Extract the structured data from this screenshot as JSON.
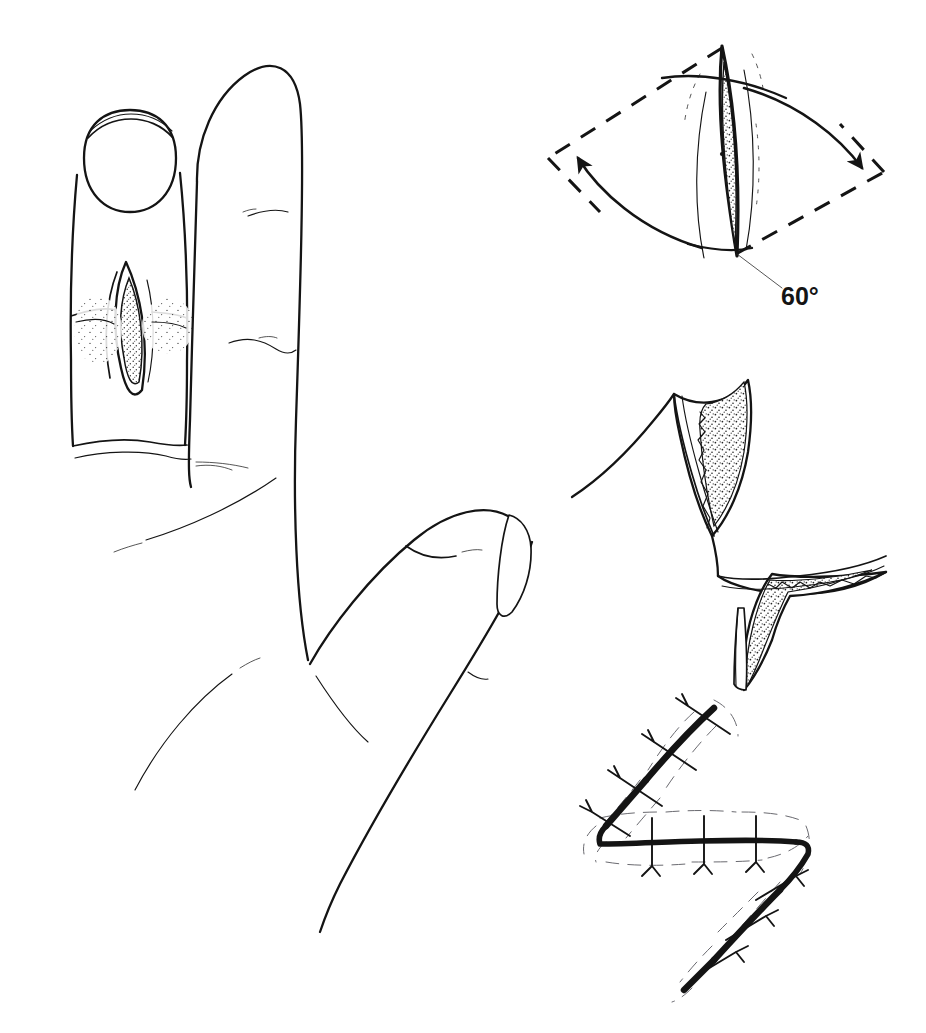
{
  "figure": {
    "background_color": "#ffffff",
    "ink_color": "#141414",
    "width": 926,
    "height": 1033,
    "style": "line-art medical illustration, pen and ink with stipple shading"
  },
  "panels": [
    {
      "id": "panel-hand",
      "name": "hand-with-nail-fold-scar",
      "position": "left",
      "caption": "Hand showing index finger with a longitudinal lens-shaped scar contracture at the nail fold, adjacent finger, and thumb",
      "elements": [
        "index-fingertip",
        "fingernail",
        "scar-contracture",
        "adjacent-finger",
        "thumb",
        "palm",
        "web-space",
        "skin-creases"
      ]
    },
    {
      "id": "panel-design",
      "name": "z-plasty-incision-design",
      "position": "top-right",
      "caption": "Z-plasty design: central lens-shaped scar with limbs marked at 60 degrees, arrows showing flap transposition",
      "angle_label": "60°",
      "elements": [
        "dashed-limb-upper-left",
        "dashed-limb-lower-right",
        "central-lens-scar",
        "rotation-arrow-left",
        "rotation-arrow-right",
        "leader-line",
        "angle-label"
      ]
    },
    {
      "id": "panel-flaps",
      "name": "transposed-triangular-flaps",
      "position": "middle-right",
      "caption": "Two triangular flaps elevated and transposed, stippled undersurfaces showing subcutaneous tissue",
      "elements": [
        "upper-triangular-flap",
        "lower-triangular-flap",
        "flap-undersurface-stipple",
        "flap-skin-edge"
      ]
    },
    {
      "id": "panel-closure",
      "name": "sutured-z-plasty-closure",
      "position": "bottom-right",
      "caption": "Completed Z-plasty closure with interrupted sutures along the transposed limbs",
      "suture_count": 12,
      "elements": [
        "upper-limb-incision",
        "transverse-limb-incision",
        "lower-limb-incision",
        "interrupted-sutures",
        "wound-edge-guides"
      ]
    }
  ],
  "labels": {
    "angle": "60°"
  },
  "accessibility": {
    "alt": "Four-panel surgical line drawing. Left: a hand with the index finger showing a narrow stippled lens-shaped scar at the nail fold. Top right: the Z-plasty design with 60 degree limbs marked by dashed lines and curved transposition arrows. Middle right: the two triangular flaps raised and transposed. Bottom right: the final sutured Z-shaped closure."
  }
}
